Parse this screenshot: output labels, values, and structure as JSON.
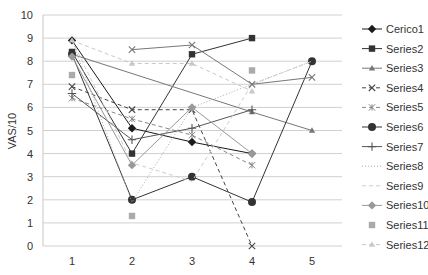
{
  "chart_data": {
    "type": "line",
    "title": "",
    "xlabel": "",
    "ylabel": "VAS/10",
    "x": [
      1,
      2,
      3,
      4,
      5
    ],
    "x_tick_labels": [
      "1",
      "2",
      "3",
      "4",
      "5"
    ],
    "y_tick_labels": [
      "0",
      "1",
      "2",
      "3",
      "4",
      "5",
      "6",
      "7",
      "8",
      "9",
      "10"
    ],
    "ylim": [
      0,
      10
    ],
    "grid": true,
    "legend_position": "right",
    "series": [
      {
        "name": "Cerico1",
        "values": [
          8.9,
          5.1,
          4.5,
          4.0,
          null
        ],
        "marker": "diamond",
        "dash": "solid",
        "color": "#1a1a1a"
      },
      {
        "name": "Series2",
        "values": [
          8.4,
          4.0,
          8.3,
          9.0,
          null
        ],
        "marker": "square",
        "dash": "solid",
        "color": "#333333"
      },
      {
        "name": "Series3",
        "values": [
          8.3,
          null,
          null,
          5.8,
          5.0
        ],
        "marker": "triangle",
        "dash": "solid",
        "color": "#777777"
      },
      {
        "name": "Series4",
        "values": [
          6.9,
          5.9,
          5.9,
          0.0,
          null
        ],
        "marker": "x",
        "dash": "dashed",
        "color": "#444444"
      },
      {
        "name": "Series5",
        "values": [
          6.4,
          5.5,
          4.8,
          3.5,
          null
        ],
        "marker": "star",
        "dash": "dashed",
        "color": "#888888"
      },
      {
        "name": "Series6",
        "values": [
          8.3,
          2.0,
          3.0,
          1.9,
          8.0
        ],
        "marker": "circle",
        "dash": "solid",
        "color": "#333333"
      },
      {
        "name": "Series7",
        "values": [
          6.6,
          4.6,
          5.1,
          5.9,
          null
        ],
        "marker": "plus",
        "dash": "solid",
        "color": "#555555"
      },
      {
        "name": "Series8",
        "values": [
          8.9,
          1.9,
          6.0,
          7.0,
          8.0
        ],
        "marker": "none",
        "dash": "dotted",
        "color": "#aaaaaa"
      },
      {
        "name": "Series9",
        "values": [
          8.9,
          3.6,
          2.8,
          7.0,
          8.0
        ],
        "marker": "none",
        "dash": "dashed",
        "color": "#cccccc"
      },
      {
        "name": "Series10",
        "values": [
          8.2,
          3.5,
          6.0,
          4.0,
          null
        ],
        "marker": "diamond",
        "dash": "solid",
        "color": "#999999"
      },
      {
        "name": "Series11",
        "values": [
          7.4,
          1.3,
          null,
          7.6,
          null
        ],
        "marker": "square",
        "dash": "none",
        "color": "#aaaaaa"
      },
      {
        "name": "Series12",
        "values": [
          8.9,
          7.9,
          7.9,
          6.7,
          null
        ],
        "marker": "triangle",
        "dash": "dashed",
        "color": "#c8c8c8"
      },
      {
        "name": "Series4b",
        "values": [
          null,
          8.5,
          8.7,
          7.0,
          7.3
        ],
        "marker": "x",
        "dash": "solid",
        "color": "#777777",
        "legend": false
      }
    ]
  },
  "legend": {
    "items": [
      "Cerico1",
      "Series2",
      "Series3",
      "Series4",
      "Series5",
      "Series6",
      "Series7",
      "Series8",
      "Series9",
      "Series10",
      "Series11",
      "Series12"
    ]
  },
  "axes": {
    "ylabel": "VAS/10"
  }
}
